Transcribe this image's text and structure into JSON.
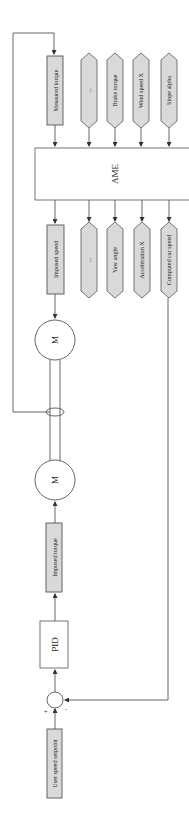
{
  "diagram": {
    "title": "",
    "orientation": "rotated-90",
    "nodes": {
      "ame": {
        "label": "AME"
      },
      "measured_torque": {
        "label": "Measured torque"
      },
      "imposed_speed": {
        "label": "Imposed speed"
      },
      "imposed_torque": {
        "label": "Imposed torque"
      },
      "pid": {
        "label": "PID"
      },
      "user_speed_setpoint": {
        "label": "User speed setpoint"
      },
      "motor_top": {
        "label": "M"
      },
      "motor_bottom": {
        "label": "M"
      },
      "summing_junction": {
        "plus": "+",
        "minus": "-"
      }
    },
    "ame_inputs": [
      {
        "label": "..."
      },
      {
        "label": "Brake torque"
      },
      {
        "label": "Wind speed X"
      },
      {
        "label": "Slope alpha"
      }
    ],
    "ame_outputs": [
      {
        "label": "..."
      },
      {
        "label": "Yaw angle"
      },
      {
        "label": "Acceleration X"
      },
      {
        "label": "Computed car speed"
      }
    ],
    "edges": [
      {
        "from": "Torque sensor (shaft)",
        "to": "Measured torque"
      },
      {
        "from": "Measured torque",
        "to": "AME"
      },
      {
        "from": "AME",
        "to": "Imposed speed"
      },
      {
        "from": "Imposed speed",
        "to": "M (top)"
      },
      {
        "from": "User speed setpoint",
        "to": "Summing junction",
        "sign": "+"
      },
      {
        "from": "Computed car speed",
        "to": "Summing junction",
        "sign": "-"
      },
      {
        "from": "Summing junction",
        "to": "PID"
      },
      {
        "from": "PID",
        "to": "Imposed torque"
      },
      {
        "from": "Imposed torque",
        "to": "M (bottom)"
      }
    ]
  }
}
